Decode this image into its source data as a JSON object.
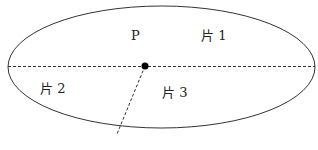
{
  "diagram": {
    "point_label": "P",
    "pieces": [
      {
        "label": "片 1"
      },
      {
        "label": "片 2"
      },
      {
        "label": "片 3"
      }
    ],
    "colors": {
      "stroke": "#333333",
      "point": "#000000"
    }
  }
}
